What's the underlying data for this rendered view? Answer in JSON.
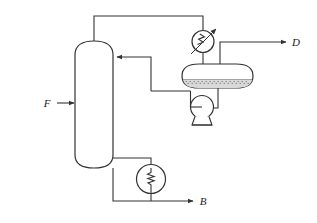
{
  "diagram": {
    "type": "process-flow-diagram",
    "line_color": "#333333",
    "fill_color": "#ffffff",
    "liquid_color": "#d9d9d9",
    "equipment": [
      {
        "id": "distillation-column",
        "name": "distillation-column",
        "shape": "vertical-vessel-domed-ends",
        "label": ""
      },
      {
        "id": "overhead-condenser",
        "name": "condenser",
        "shape": "circle-with-zigzag-and-arrow",
        "label": ""
      },
      {
        "id": "reflux-drum",
        "name": "reflux-drum",
        "shape": "horizontal-capsule-with-liquid-level",
        "label": ""
      },
      {
        "id": "reflux-pump",
        "name": "pump",
        "shape": "centrifugal-pump",
        "label": ""
      },
      {
        "id": "reboiler",
        "name": "reboiler",
        "shape": "circle-with-zigzag",
        "label": ""
      }
    ],
    "streams": [
      {
        "id": "feed",
        "label": "F",
        "direction": "into-column",
        "x": 47,
        "y": 103
      },
      {
        "id": "distillate",
        "label": "D",
        "direction": "out-right",
        "x": 296,
        "y": 42
      },
      {
        "id": "bottoms",
        "label": "B",
        "direction": "out-right",
        "x": 203,
        "y": 201
      }
    ]
  }
}
